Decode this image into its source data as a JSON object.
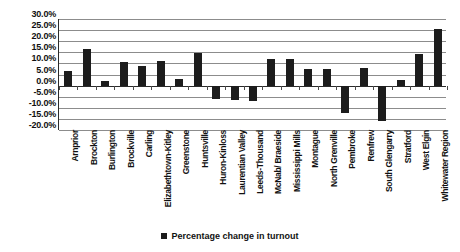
{
  "chart_data": {
    "type": "bar",
    "title": "",
    "subtitle": "",
    "xlabel": "",
    "ylabel": "",
    "ylim": [
      -20,
      30
    ],
    "ytick_step": 5,
    "ytick_labels": [
      "30.0%",
      "25.0%",
      "20.0%",
      "15.0%",
      "10.0%",
      "5.0%",
      "0.0%",
      "-5.0%",
      "-10.0%",
      "-15.0%",
      "-20.0%"
    ],
    "ytick_values": [
      30,
      25,
      20,
      15,
      10,
      5,
      0,
      -5,
      -10,
      -15,
      -20
    ],
    "grid": true,
    "legend_position": "bottom",
    "legend": [
      "Percentage change in turnout"
    ],
    "series": [
      {
        "name": "Percentage change in turnout",
        "color": "#1c1c1c",
        "values": [
          6.5,
          16.5,
          2.0,
          10.8,
          9.0,
          11.2,
          3.0,
          14.8,
          -6.0,
          -6.5,
          -7.0,
          12.0,
          12.0,
          7.7,
          7.7,
          -12.5,
          8.0,
          -16.0,
          2.6,
          14.2,
          25.4
        ]
      }
    ],
    "categories": [
      "Arnprior",
      "Brockton",
      "Burlington",
      "Brockville",
      "Carling",
      "Elizabethtown-Kitley",
      "Greenstone",
      "Huntsville",
      "Huron-Kinloss",
      "Laurentian Valley",
      "Leeds-Thousand",
      "McNab/ Braeside",
      "Mississippi Mills",
      "Montague",
      "North Grenville",
      "Pembroke",
      "Renfrew",
      "South Glengarry",
      "Stratford",
      "West Elgin",
      "Whitewater Region"
    ]
  },
  "legend": {
    "label": "Percentage change in turnout",
    "swatch_color": "#1c1c1c"
  }
}
